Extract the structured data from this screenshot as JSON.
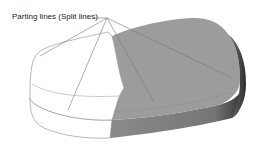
{
  "figure": {
    "annotation_label": "Parting lines (Split lines)",
    "colors": {
      "background": "#ffffff",
      "white_half_fill": "#ffffff",
      "white_half_stroke": "#8a8a8a",
      "shaded_top": "#9a9a9a",
      "shaded_side": "#7d7d7d",
      "shaded_edge_dark": "#3c3c3c",
      "leader_line": "#777777"
    }
  }
}
